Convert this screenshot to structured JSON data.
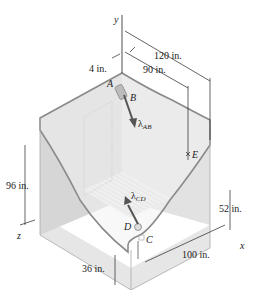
{
  "axes": {
    "x": "x",
    "y": "y",
    "z": "z"
  },
  "points": {
    "A": "A",
    "B": "B",
    "C": "C",
    "D": "D",
    "E": "E"
  },
  "vectors": {
    "ab": "λ",
    "ab_sub": "AB",
    "cd": "λ",
    "cd_sub": "CD"
  },
  "dimensions": {
    "d4": "4 in.",
    "d120": "120 in.",
    "d90": "90 in.",
    "d96": "96 in.",
    "d52": "52 in.",
    "d100": "100 in.",
    "d36": "36 in."
  },
  "colors": {
    "wall_left": "#d9d9d9",
    "wall_right": "#e4e4e4",
    "floor": "#ececec",
    "edge": "#8a8a8a",
    "arrow": "#555555"
  }
}
